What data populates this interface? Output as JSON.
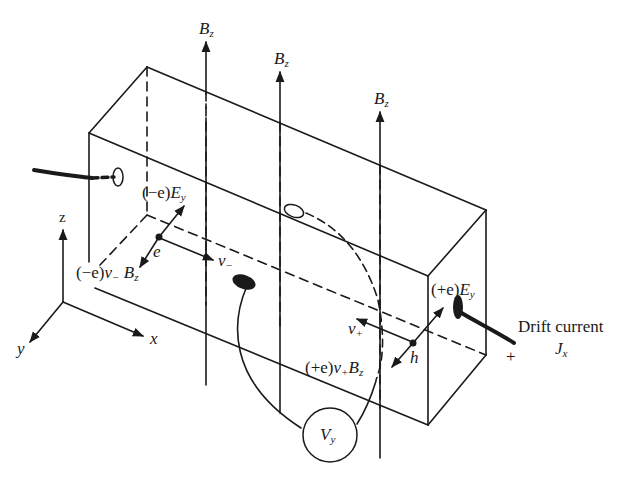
{
  "figure": {
    "axes": {
      "x": "x",
      "y": "y",
      "z": "z"
    },
    "field_labels": [
      {
        "main": "B",
        "sub": "z"
      },
      {
        "main": "B",
        "sub": "z"
      },
      {
        "main": "B",
        "sub": "z"
      }
    ],
    "electron": {
      "charge_label": "e",
      "electric_force": {
        "pre": "(−e)",
        "main": "E",
        "sub": "y"
      },
      "magnetic_force": {
        "pre": "(−e)",
        "v": "v",
        "vsub": "−",
        "main": "B",
        "sub": "z"
      },
      "velocity": {
        "main": "v",
        "sub": "−"
      }
    },
    "hole": {
      "charge_label": "h",
      "electric_force": {
        "pre": "(+e)",
        "main": "E",
        "sub": "y"
      },
      "magnetic_force": {
        "pre": "(+e)",
        "v": "v",
        "vsub": "+",
        "main": "B",
        "sub": "z"
      },
      "velocity": {
        "main": "v",
        "sub": "+"
      }
    },
    "voltmeter": {
      "main": "V",
      "sub": "y"
    },
    "current": {
      "label": "Drift current",
      "main": "J",
      "sub": "x",
      "polarity": "+"
    }
  }
}
